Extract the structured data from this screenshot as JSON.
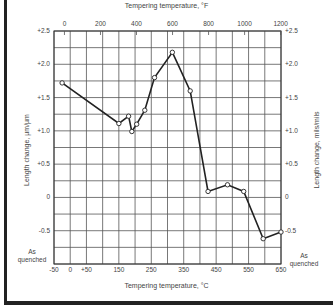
{
  "chart_data": {
    "type": "line",
    "title": "",
    "xlabel": "Tempering temperature, °C",
    "xlabel_top": "Tempering temperature, °F",
    "ylabel": "Length change, µm/µm",
    "ylabel_right": "Length change, mils/mils",
    "x_ticks_bottom": [
      "-50",
      "0",
      "+50",
      "150",
      "250",
      "350",
      "450",
      "550",
      "650"
    ],
    "x_ticks_top": [
      "0",
      "200",
      "400",
      "600",
      "800",
      "1000",
      "1200"
    ],
    "y_ticks_left": [
      "+2.5",
      "+2.0",
      "+1.5",
      "+1.0",
      "+0.5",
      "0",
      "-0.5"
    ],
    "y_ticks_right": [
      "+2.5",
      "+2.0",
      "+1.5",
      "+1.0",
      "+0.5",
      "0",
      "-0.5"
    ],
    "annotations": {
      "left_corner": "As quenched",
      "right_corner": "As quenched"
    },
    "xlim": [
      -50,
      650
    ],
    "ylim": [
      -1.0,
      2.5
    ],
    "grid": true,
    "series": [
      {
        "name": "Length change",
        "x": [
          -25,
          150,
          180,
          190,
          205,
          230,
          260,
          315,
          370,
          425,
          485,
          535,
          595,
          650
        ],
        "y": [
          1.72,
          1.11,
          1.22,
          0.99,
          1.1,
          1.31,
          1.8,
          2.18,
          1.6,
          0.09,
          0.19,
          0.09,
          -0.62,
          -0.52
        ]
      }
    ]
  }
}
